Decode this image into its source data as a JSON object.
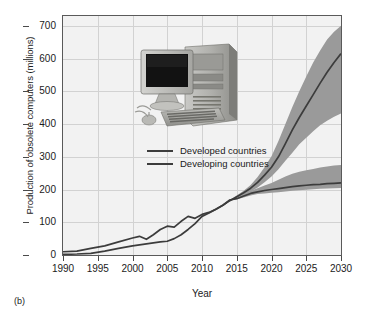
{
  "figure": {
    "caption": "(b)",
    "inset_image_name": "desktop-computer-photo"
  },
  "chart_data": {
    "type": "line",
    "title": "",
    "xlabel": "Year",
    "ylabel": "Production of obsolete computers (millions)",
    "xlim": [
      1990,
      2030
    ],
    "ylim": [
      0,
      730
    ],
    "xticks": [
      1990,
      1995,
      2000,
      2005,
      2010,
      2015,
      2020,
      2025,
      2030
    ],
    "yticks": [
      0,
      100,
      200,
      300,
      400,
      500,
      600,
      700
    ],
    "grid": true,
    "legend_position": "upper-left-inside",
    "band_color": "#9a9a9a",
    "line_color": "#3c3c3c",
    "plot_background": "#f2f2f2",
    "grid_color": "#d2d2d2",
    "series": [
      {
        "name": "Developed countries",
        "x": [
          1990,
          1992,
          1994,
          1996,
          1998,
          2000,
          2001,
          2002,
          2003,
          2004,
          2005,
          2006,
          2007,
          2008,
          2009,
          2010,
          2011,
          2012,
          2013,
          2014,
          2015,
          2016,
          2017,
          2018,
          2019,
          2020,
          2021,
          2022,
          2023,
          2024,
          2025,
          2026,
          2027,
          2028,
          2029,
          2030
        ],
        "values": [
          10,
          12,
          20,
          28,
          40,
          52,
          57,
          48,
          62,
          78,
          88,
          85,
          103,
          118,
          112,
          124,
          130,
          140,
          152,
          168,
          172,
          180,
          188,
          193,
          197,
          200,
          203,
          206,
          209,
          211,
          213,
          215,
          216,
          218,
          219,
          220
        ],
        "band_low": [
          10,
          12,
          20,
          28,
          40,
          52,
          57,
          48,
          62,
          78,
          88,
          85,
          103,
          118,
          112,
          124,
          130,
          140,
          152,
          166,
          170,
          176,
          182,
          186,
          188,
          190,
          192,
          194,
          196,
          198,
          199,
          201,
          202,
          203,
          204,
          205
        ],
        "band_high": [
          10,
          12,
          20,
          28,
          40,
          52,
          57,
          48,
          62,
          78,
          88,
          85,
          103,
          118,
          112,
          124,
          130,
          140,
          152,
          170,
          176,
          186,
          196,
          204,
          212,
          220,
          230,
          240,
          248,
          254,
          259,
          263,
          267,
          270,
          273,
          275
        ]
      },
      {
        "name": "Developing countries",
        "x": [
          1990,
          1992,
          1994,
          1996,
          1998,
          2000,
          2002,
          2004,
          2005,
          2006,
          2007,
          2008,
          2009,
          2010,
          2011,
          2012,
          2013,
          2014,
          2015,
          2016,
          2017,
          2018,
          2019,
          2020,
          2021,
          2022,
          2023,
          2024,
          2025,
          2026,
          2027,
          2028,
          2029,
          2030
        ],
        "values": [
          2,
          3,
          5,
          12,
          20,
          28,
          34,
          40,
          42,
          50,
          62,
          78,
          96,
          118,
          128,
          140,
          152,
          166,
          178,
          190,
          204,
          222,
          244,
          268,
          300,
          340,
          382,
          420,
          455,
          490,
          525,
          558,
          588,
          615
        ],
        "band_low": [
          2,
          3,
          5,
          12,
          20,
          28,
          34,
          40,
          42,
          50,
          62,
          78,
          96,
          118,
          128,
          140,
          152,
          164,
          174,
          184,
          194,
          206,
          222,
          240,
          262,
          288,
          312,
          338,
          358,
          378,
          396,
          410,
          422,
          432
        ],
        "band_high": [
          2,
          3,
          5,
          12,
          20,
          28,
          34,
          40,
          42,
          50,
          62,
          78,
          96,
          118,
          128,
          140,
          152,
          168,
          182,
          196,
          214,
          238,
          268,
          302,
          348,
          400,
          452,
          500,
          545,
          588,
          625,
          658,
          682,
          700
        ]
      }
    ]
  }
}
